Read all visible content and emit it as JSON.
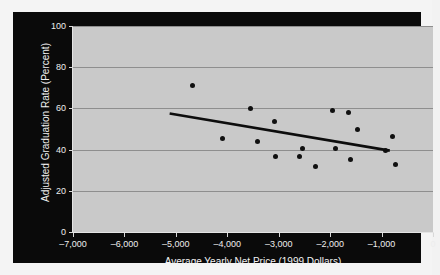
{
  "chart_data": {
    "type": "scatter",
    "title": "",
    "xlabel": "Average Yearly Net Price (1999 Dollars)",
    "ylabel": "Adjusted Graduation Rate (Percent)",
    "xlim": [
      -7000,
      0
    ],
    "ylim": [
      0,
      100
    ],
    "xticks": [
      -7000,
      -6000,
      -5000,
      -4000,
      -3000,
      -2000,
      -1000,
      0
    ],
    "xtick_labels": [
      "–7,000",
      "–6,000",
      "–5,000",
      "–4,000",
      "–3,000",
      "–2,000",
      "–1,000",
      "0"
    ],
    "yticks": [
      0,
      20,
      40,
      60,
      80,
      100
    ],
    "ytick_labels": [
      "0",
      "20",
      "40",
      "60",
      "80",
      "100"
    ],
    "grid": "horizontal",
    "legend": "none",
    "points": [
      {
        "x": -4680,
        "y": 71.0
      },
      {
        "x": -4100,
        "y": 45.5
      },
      {
        "x": -3540,
        "y": 60.0
      },
      {
        "x": -3420,
        "y": 44.0
      },
      {
        "x": -3090,
        "y": 53.5
      },
      {
        "x": -3060,
        "y": 36.5
      },
      {
        "x": -2600,
        "y": 36.5
      },
      {
        "x": -2540,
        "y": 40.5
      },
      {
        "x": -2290,
        "y": 32.0
      },
      {
        "x": -1950,
        "y": 59.0
      },
      {
        "x": -1890,
        "y": 40.5
      },
      {
        "x": -1650,
        "y": 58.0
      },
      {
        "x": -1600,
        "y": 35.0
      },
      {
        "x": -1460,
        "y": 50.0
      },
      {
        "x": -930,
        "y": 39.5
      },
      {
        "x": -790,
        "y": 46.5
      },
      {
        "x": -730,
        "y": 33.0
      }
    ],
    "trendline": {
      "x_start": -5120,
      "y_start": 57.5,
      "x_end": -840,
      "y_end": 39.5
    }
  }
}
